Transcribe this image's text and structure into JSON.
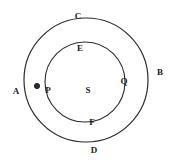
{
  "figure": {
    "type": "geometry-diagram",
    "background_color": "#ffffff",
    "stroke_color": "#2b2b2b",
    "label_color": "#1a1a1a",
    "outer_circle": {
      "name": "outer-circle",
      "center_x": 86,
      "center_y": 80,
      "radius": 62,
      "stroke_width": 1.2
    },
    "inner_circle": {
      "name": "inner-circle",
      "center_x": 85,
      "center_y": 82,
      "radius": 40,
      "stroke_width": 1.1
    },
    "center_point": {
      "label": "S",
      "x": 88,
      "y": 90
    },
    "marked_point": {
      "label": "P",
      "dot_x": 37,
      "dot_y": 86,
      "dot_radius": 2.6,
      "label_x": 48,
      "label_y": 90
    },
    "labels": [
      {
        "id": "label-c",
        "text": "C",
        "x": 78,
        "y": 16
      },
      {
        "id": "label-e",
        "text": "E",
        "x": 80,
        "y": 48
      },
      {
        "id": "label-b",
        "text": "B",
        "x": 160,
        "y": 72
      },
      {
        "id": "label-q",
        "text": "Q",
        "x": 124,
        "y": 81
      },
      {
        "id": "label-a",
        "text": "A",
        "x": 16,
        "y": 91
      },
      {
        "id": "label-s",
        "text": "S",
        "x": 88,
        "y": 90
      },
      {
        "id": "label-f",
        "text": "F",
        "x": 92,
        "y": 122
      },
      {
        "id": "label-d",
        "text": "D",
        "x": 94,
        "y": 150
      },
      {
        "id": "label-p",
        "text": "P",
        "x": 48,
        "y": 90
      }
    ]
  }
}
